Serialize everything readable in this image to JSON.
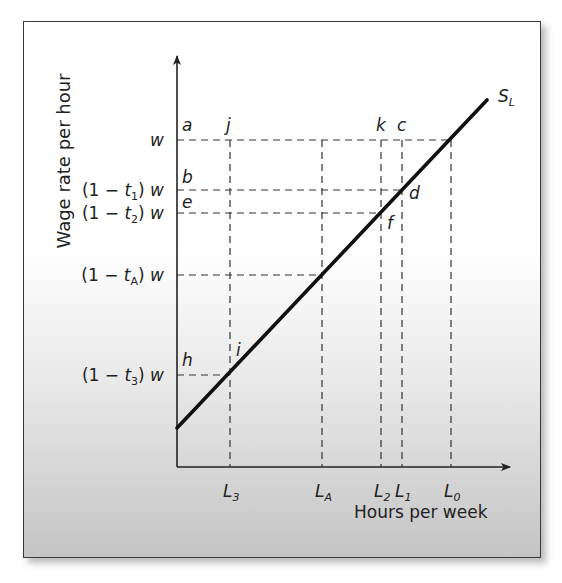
{
  "figure": {
    "y_axis_label": "Wage rate per hour",
    "x_axis_label": "Hours per week",
    "curve_label": {
      "main": "S",
      "sub": "L"
    }
  },
  "colors": {
    "line": "#111111",
    "axis": "#222222",
    "dash": "#333333",
    "frame": "#3a3a3a"
  },
  "geometry": {
    "origin": [
      177,
      467
    ],
    "y_axis_top": 56,
    "x_axis_right": 510,
    "supply_line": {
      "start": [
        177,
        428
      ],
      "end": [
        487,
        100
      ]
    }
  },
  "y_levels": [
    {
      "id": "w",
      "y": 140,
      "prefix": "",
      "sub": "",
      "label_text": "w",
      "point_letter": "a",
      "extends_to_x": 451
    },
    {
      "id": "t1",
      "y": 190,
      "prefix": "(1 − t",
      "sub": "1",
      "label_text": ") w",
      "point_letter": "b",
      "extends_to_x": 402
    },
    {
      "id": "t2",
      "y": 213,
      "prefix": "(1 − t",
      "sub": "2",
      "label_text": ") w",
      "point_letter": "e",
      "extends_to_x": 381
    },
    {
      "id": "tA",
      "y": 275,
      "prefix": "(1 − t",
      "sub": "A",
      "label_text": ") w",
      "point_letter": "",
      "extends_to_x": 322
    },
    {
      "id": "t3",
      "y": 375,
      "prefix": "(1 − t",
      "sub": "3",
      "label_text": ") w",
      "point_letter": "h",
      "extends_to_x": 230
    }
  ],
  "x_levels": [
    {
      "id": "L3",
      "x": 230,
      "main": "L",
      "sub": "3",
      "top_y": 140,
      "top_letter": "j",
      "curve_letter": "i",
      "curve_y": 375
    },
    {
      "id": "LA",
      "x": 322,
      "main": "L",
      "sub": "A",
      "top_y": 140,
      "top_letter": "",
      "curve_letter": "",
      "curve_y": 275
    },
    {
      "id": "L2",
      "x": 381,
      "main": "L",
      "sub": "2",
      "top_y": 140,
      "top_letter": "k",
      "curve_letter": "f",
      "curve_y": 213
    },
    {
      "id": "L1",
      "x": 402,
      "main": "L",
      "sub": "1",
      "top_y": 140,
      "top_letter": "c",
      "curve_letter": "d",
      "curve_y": 190
    },
    {
      "id": "L0",
      "x": 451,
      "main": "L",
      "sub": "0",
      "top_y": 140,
      "top_letter": "",
      "curve_letter": "",
      "curve_y": 140
    }
  ],
  "point_labels": [
    {
      "letter": "a",
      "x": 182,
      "y": 131
    },
    {
      "letter": "j",
      "x": 226,
      "y": 131
    },
    {
      "letter": "k",
      "x": 376,
      "y": 131
    },
    {
      "letter": "c",
      "x": 397,
      "y": 131
    },
    {
      "letter": "b",
      "x": 182,
      "y": 183
    },
    {
      "letter": "e",
      "x": 182,
      "y": 208
    },
    {
      "letter": "d",
      "x": 409,
      "y": 199
    },
    {
      "letter": "f",
      "x": 387,
      "y": 229
    },
    {
      "letter": "h",
      "x": 182,
      "y": 366
    },
    {
      "letter": "i",
      "x": 236,
      "y": 356
    }
  ]
}
